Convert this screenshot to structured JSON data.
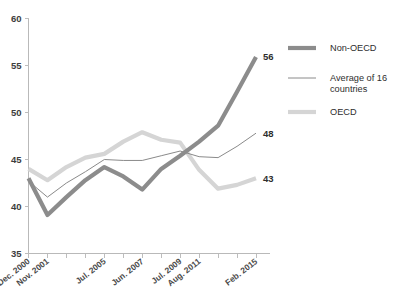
{
  "chart_data": {
    "type": "line",
    "title": "",
    "subtitle": "",
    "xlabel": "",
    "ylabel": "",
    "ylim": [
      35,
      60
    ],
    "yticks": [
      35,
      40,
      45,
      50,
      55,
      60
    ],
    "grid": false,
    "legend_position": "right",
    "x": [
      0,
      1,
      2,
      3,
      4,
      5,
      6,
      7,
      8,
      9,
      10,
      11,
      12
    ],
    "categories": [
      "Dec. 2000",
      "Nov. 2001",
      "",
      "",
      "Jul. 2005",
      "",
      "Jun. 2007",
      "",
      "Jul. 2009",
      "Aug. 2011",
      "",
      "",
      "Feb. 2015"
    ],
    "tick_labels": [
      {
        "index": 0,
        "label": "Dec. 2000"
      },
      {
        "index": 1,
        "label": "Nov. 2001"
      },
      {
        "index": 4,
        "label": "Jul. 2005"
      },
      {
        "index": 6,
        "label": "Jun. 2007"
      },
      {
        "index": 8,
        "label": "Jul. 2009"
      },
      {
        "index": 9,
        "label": "Aug. 2011"
      },
      {
        "index": 12,
        "label": "Feb. 2015"
      }
    ],
    "series": [
      {
        "name": "Non-OECD",
        "color": "#8c8c8c",
        "width": 4.2,
        "end_label": "56",
        "values": [
          43.0,
          39.1,
          41.0,
          42.8,
          44.2,
          43.2,
          41.8,
          44.0,
          45.4,
          46.9,
          48.6,
          52.2,
          55.9
        ]
      },
      {
        "name": "Average of 16 countries",
        "color": "#8a8a8a",
        "width": 1.0,
        "end_label": "48",
        "values": [
          42.7,
          41.0,
          42.5,
          43.7,
          45.0,
          44.9,
          44.9,
          45.4,
          45.9,
          45.3,
          45.2,
          46.4,
          47.8
        ]
      },
      {
        "name": "OECD",
        "color": "#d5d5d5",
        "width": 4.2,
        "end_label": "43",
        "values": [
          44.0,
          42.8,
          44.2,
          45.2,
          45.6,
          46.9,
          47.9,
          47.1,
          46.8,
          43.9,
          41.9,
          42.3,
          43.0
        ]
      }
    ]
  },
  "legend": {
    "items": [
      {
        "label": "Non-OECD",
        "color": "#8c8c8c",
        "width": 4.2
      },
      {
        "label": "Average of 16 countries",
        "color": "#8a8a8a",
        "width": 1.0
      },
      {
        "label": "OECD",
        "color": "#d5d5d5",
        "width": 4.2
      }
    ]
  },
  "colors": {
    "non_oecd": "#8c8c8c",
    "average": "#8a8a8a",
    "oecd": "#d5d5d5",
    "axis": "#b9b9b9",
    "text": "#2e2e2e"
  }
}
